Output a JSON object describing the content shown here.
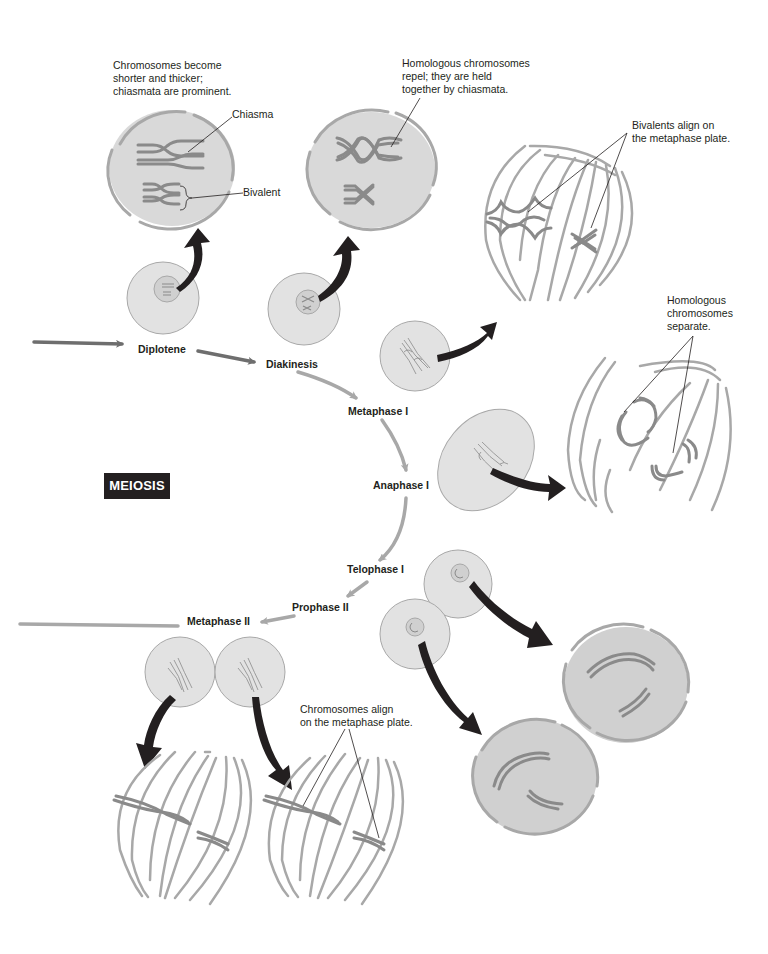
{
  "diagram": {
    "title_badge": "MEIOSIS",
    "colors": {
      "cell_fill": "#dcdcdc",
      "cell_stroke": "#a8a8a8",
      "chromosome": "#8a8a8a",
      "spindle": "#a8a8a8",
      "flow_arrow_dark": "#6e6e6e",
      "flow_arrow_light": "#a8a8a8",
      "zoom_arrow": "#231f20",
      "badge_bg": "#231f20",
      "text": "#231f20"
    },
    "stages": [
      {
        "id": "diplotene",
        "label": "Diplotene"
      },
      {
        "id": "diakinesis",
        "label": "Diakinesis"
      },
      {
        "id": "metaphase-1",
        "label": "Metaphase I"
      },
      {
        "id": "anaphase-1",
        "label": "Anaphase I"
      },
      {
        "id": "telophase-1",
        "label": "Telophase I"
      },
      {
        "id": "prophase-2",
        "label": "Prophase II"
      },
      {
        "id": "metaphase-2",
        "label": "Metaphase II"
      }
    ],
    "annotations": {
      "diplotene_note": "Chromosomes become\nshorter and thicker;\nchiasmata are prominent.",
      "chiasma_label": "Chiasma",
      "bivalent_label": "Bivalent",
      "diakinesis_note": "Homologous chromosomes\nrepel; they are held\ntogether by chiasmata.",
      "metaphase1_note": "Bivalents align on\nthe metaphase plate.",
      "anaphase1_note": "Homologous\nchromosomes\nseparate.",
      "metaphase2_note": "Chromosomes align\non the metaphase plate."
    }
  }
}
